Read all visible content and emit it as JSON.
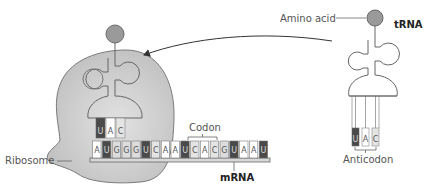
{
  "labels": {
    "amino_acid": "Amino acid",
    "trna": "tRNA",
    "anticodon": "Anticodon",
    "codon": "Codon",
    "ribosome": "Ribosome",
    "mrna": "mRNA"
  },
  "mrna_sequence": [
    "A",
    "U",
    "G",
    "G",
    "G",
    "U",
    "C",
    "A",
    "A",
    "U",
    "C",
    "A",
    "C",
    "G",
    "U",
    "A",
    "A",
    "U"
  ],
  "bound_trna_anticodon": [
    "U",
    "A",
    "C"
  ],
  "free_trna_anticodon": [
    "U",
    "A",
    "C"
  ],
  "highlighted_codon": [
    "C",
    "A",
    "C"
  ],
  "colors": {
    "ribosome_fill": "#c8c8c8",
    "ribosome_stroke": "#7a7a7a",
    "amino_acid_fill": "#9a9a9a",
    "nucleotide_U": "#4a4a4a",
    "nucleotide_A": "#ffffff",
    "nucleotide_G": "#dcdcdc",
    "nucleotide_C": "#e4e4e4",
    "line": "#555555"
  }
}
